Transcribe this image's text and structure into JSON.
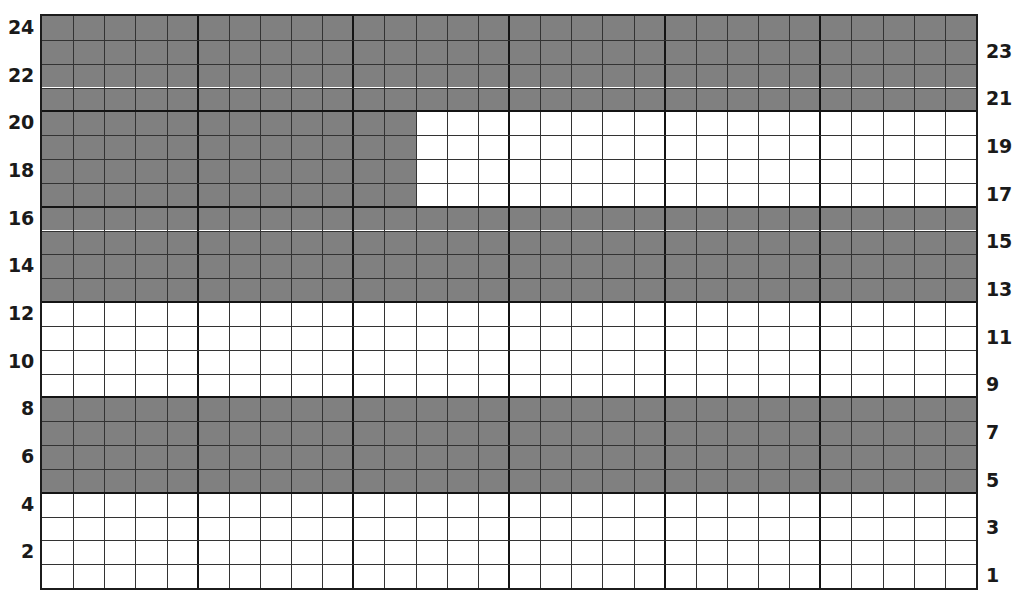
{
  "chart_data": {
    "type": "heatmap",
    "title": "",
    "subtitle": "",
    "xlabel": "",
    "ylabel": "",
    "legend": [],
    "grid": true,
    "columns": 30,
    "rows": 24,
    "row_order": "bottom-to-top",
    "colors": {
      "filled": "#808080",
      "empty": "#ffffff",
      "gridline": "#333333",
      "gridline_major": "#141414",
      "border": "#1c1c1c",
      "label": "#1a1a1a"
    },
    "axes": {
      "left": {
        "position": "left",
        "tick_labels": [
          "24",
          "22",
          "20",
          "18",
          "16",
          "14",
          "12",
          "10",
          "8",
          "6",
          "4",
          "2"
        ],
        "tick_rows": [
          24,
          22,
          20,
          18,
          16,
          14,
          12,
          10,
          8,
          6,
          4,
          2
        ]
      },
      "right": {
        "position": "right",
        "tick_labels": [
          "23",
          "21",
          "19",
          "17",
          "15",
          "13",
          "11",
          "9",
          "7",
          "5",
          "3",
          "1"
        ],
        "tick_rows": [
          23,
          21,
          19,
          17,
          15,
          13,
          11,
          9,
          7,
          5,
          3,
          1
        ]
      }
    },
    "major_gridlines": {
      "vertical_every": 5,
      "horizontal_every": 4
    },
    "bands": [
      {
        "rows": [
          21,
          24
        ],
        "columns": [
          1,
          30
        ],
        "state": "filled"
      },
      {
        "rows": [
          17,
          20
        ],
        "columns": [
          1,
          12
        ],
        "state": "filled"
      },
      {
        "rows": [
          17,
          20
        ],
        "columns": [
          13,
          30
        ],
        "state": "empty"
      },
      {
        "rows": [
          13,
          16
        ],
        "columns": [
          1,
          30
        ],
        "state": "filled"
      },
      {
        "rows": [
          9,
          12
        ],
        "columns": [
          1,
          30
        ],
        "state": "empty"
      },
      {
        "rows": [
          5,
          8
        ],
        "columns": [
          1,
          30
        ],
        "state": "filled"
      },
      {
        "rows": [
          1,
          4
        ],
        "columns": [
          1,
          30
        ],
        "state": "empty"
      }
    ],
    "values": [
      [
        0,
        0,
        0,
        0,
        0,
        0,
        0,
        0,
        0,
        0,
        0,
        0,
        0,
        0,
        0,
        0,
        0,
        0,
        0,
        0,
        0,
        0,
        0,
        0,
        0,
        0,
        0,
        0,
        0,
        0
      ],
      [
        0,
        0,
        0,
        0,
        0,
        0,
        0,
        0,
        0,
        0,
        0,
        0,
        0,
        0,
        0,
        0,
        0,
        0,
        0,
        0,
        0,
        0,
        0,
        0,
        0,
        0,
        0,
        0,
        0,
        0
      ],
      [
        0,
        0,
        0,
        0,
        0,
        0,
        0,
        0,
        0,
        0,
        0,
        0,
        0,
        0,
        0,
        0,
        0,
        0,
        0,
        0,
        0,
        0,
        0,
        0,
        0,
        0,
        0,
        0,
        0,
        0
      ],
      [
        0,
        0,
        0,
        0,
        0,
        0,
        0,
        0,
        0,
        0,
        0,
        0,
        0,
        0,
        0,
        0,
        0,
        0,
        0,
        0,
        0,
        0,
        0,
        0,
        0,
        0,
        0,
        0,
        0,
        0
      ],
      [
        1,
        1,
        1,
        1,
        1,
        1,
        1,
        1,
        1,
        1,
        1,
        1,
        1,
        1,
        1,
        1,
        1,
        1,
        1,
        1,
        1,
        1,
        1,
        1,
        1,
        1,
        1,
        1,
        1,
        1
      ],
      [
        1,
        1,
        1,
        1,
        1,
        1,
        1,
        1,
        1,
        1,
        1,
        1,
        1,
        1,
        1,
        1,
        1,
        1,
        1,
        1,
        1,
        1,
        1,
        1,
        1,
        1,
        1,
        1,
        1,
        1
      ],
      [
        1,
        1,
        1,
        1,
        1,
        1,
        1,
        1,
        1,
        1,
        1,
        1,
        1,
        1,
        1,
        1,
        1,
        1,
        1,
        1,
        1,
        1,
        1,
        1,
        1,
        1,
        1,
        1,
        1,
        1
      ],
      [
        1,
        1,
        1,
        1,
        1,
        1,
        1,
        1,
        1,
        1,
        1,
        1,
        1,
        1,
        1,
        1,
        1,
        1,
        1,
        1,
        1,
        1,
        1,
        1,
        1,
        1,
        1,
        1,
        1,
        1
      ],
      [
        0,
        0,
        0,
        0,
        0,
        0,
        0,
        0,
        0,
        0,
        0,
        0,
        0,
        0,
        0,
        0,
        0,
        0,
        0,
        0,
        0,
        0,
        0,
        0,
        0,
        0,
        0,
        0,
        0,
        0
      ],
      [
        0,
        0,
        0,
        0,
        0,
        0,
        0,
        0,
        0,
        0,
        0,
        0,
        0,
        0,
        0,
        0,
        0,
        0,
        0,
        0,
        0,
        0,
        0,
        0,
        0,
        0,
        0,
        0,
        0,
        0
      ],
      [
        0,
        0,
        0,
        0,
        0,
        0,
        0,
        0,
        0,
        0,
        0,
        0,
        0,
        0,
        0,
        0,
        0,
        0,
        0,
        0,
        0,
        0,
        0,
        0,
        0,
        0,
        0,
        0,
        0,
        0
      ],
      [
        0,
        0,
        0,
        0,
        0,
        0,
        0,
        0,
        0,
        0,
        0,
        0,
        0,
        0,
        0,
        0,
        0,
        0,
        0,
        0,
        0,
        0,
        0,
        0,
        0,
        0,
        0,
        0,
        0,
        0
      ],
      [
        1,
        1,
        1,
        1,
        1,
        1,
        1,
        1,
        1,
        1,
        1,
        1,
        1,
        1,
        1,
        1,
        1,
        1,
        1,
        1,
        1,
        1,
        1,
        1,
        1,
        1,
        1,
        1,
        1,
        1
      ],
      [
        1,
        1,
        1,
        1,
        1,
        1,
        1,
        1,
        1,
        1,
        1,
        1,
        1,
        1,
        1,
        1,
        1,
        1,
        1,
        1,
        1,
        1,
        1,
        1,
        1,
        1,
        1,
        1,
        1,
        1
      ],
      [
        1,
        1,
        1,
        1,
        1,
        1,
        1,
        1,
        1,
        1,
        1,
        1,
        1,
        1,
        1,
        1,
        1,
        1,
        1,
        1,
        1,
        1,
        1,
        1,
        1,
        1,
        1,
        1,
        1,
        1
      ],
      [
        1,
        1,
        1,
        1,
        1,
        1,
        1,
        1,
        1,
        1,
        1,
        1,
        1,
        1,
        1,
        1,
        1,
        1,
        1,
        1,
        1,
        1,
        1,
        1,
        1,
        1,
        1,
        1,
        1,
        1
      ],
      [
        1,
        1,
        1,
        1,
        1,
        1,
        1,
        1,
        1,
        1,
        1,
        1,
        0,
        0,
        0,
        0,
        0,
        0,
        0,
        0,
        0,
        0,
        0,
        0,
        0,
        0,
        0,
        0,
        0,
        0
      ],
      [
        1,
        1,
        1,
        1,
        1,
        1,
        1,
        1,
        1,
        1,
        1,
        1,
        0,
        0,
        0,
        0,
        0,
        0,
        0,
        0,
        0,
        0,
        0,
        0,
        0,
        0,
        0,
        0,
        0,
        0
      ],
      [
        1,
        1,
        1,
        1,
        1,
        1,
        1,
        1,
        1,
        1,
        1,
        1,
        0,
        0,
        0,
        0,
        0,
        0,
        0,
        0,
        0,
        0,
        0,
        0,
        0,
        0,
        0,
        0,
        0,
        0
      ],
      [
        1,
        1,
        1,
        1,
        1,
        1,
        1,
        1,
        1,
        1,
        1,
        1,
        0,
        0,
        0,
        0,
        0,
        0,
        0,
        0,
        0,
        0,
        0,
        0,
        0,
        0,
        0,
        0,
        0,
        0
      ],
      [
        1,
        1,
        1,
        1,
        1,
        1,
        1,
        1,
        1,
        1,
        1,
        1,
        1,
        1,
        1,
        1,
        1,
        1,
        1,
        1,
        1,
        1,
        1,
        1,
        1,
        1,
        1,
        1,
        1,
        1
      ],
      [
        1,
        1,
        1,
        1,
        1,
        1,
        1,
        1,
        1,
        1,
        1,
        1,
        1,
        1,
        1,
        1,
        1,
        1,
        1,
        1,
        1,
        1,
        1,
        1,
        1,
        1,
        1,
        1,
        1,
        1
      ],
      [
        1,
        1,
        1,
        1,
        1,
        1,
        1,
        1,
        1,
        1,
        1,
        1,
        1,
        1,
        1,
        1,
        1,
        1,
        1,
        1,
        1,
        1,
        1,
        1,
        1,
        1,
        1,
        1,
        1,
        1
      ],
      [
        1,
        1,
        1,
        1,
        1,
        1,
        1,
        1,
        1,
        1,
        1,
        1,
        1,
        1,
        1,
        1,
        1,
        1,
        1,
        1,
        1,
        1,
        1,
        1,
        1,
        1,
        1,
        1,
        1,
        1
      ]
    ]
  }
}
